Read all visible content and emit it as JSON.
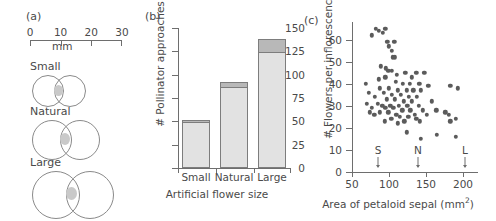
{
  "figure": {
    "panel_a_label": "(a)",
    "panel_b_label": "(b)",
    "panel_c_label": "(c)"
  },
  "panel_a": {
    "scale": {
      "ticks": [
        "0",
        "10",
        "20",
        "30"
      ],
      "unit_label": "mm",
      "min": 0,
      "max": 30
    },
    "models": [
      {
        "name": "Small",
        "circle_diameter_mm": 11,
        "center_diameter_mm": 4
      },
      {
        "name": "Natural",
        "circle_diameter_mm": 15,
        "center_diameter_mm": 4
      },
      {
        "name": "Large",
        "circle_diameter_mm": 19,
        "center_diameter_mm": 4
      }
    ]
  },
  "chart_data": [
    {
      "panel": "(b)",
      "type": "bar",
      "title": "",
      "xlabel": "Artificial flower size",
      "ylabel": "# Pollinator approaches",
      "categories": [
        "Small",
        "Natural",
        "Large"
      ],
      "values": [
        52,
        92,
        138
      ],
      "series": [
        {
          "name": "lower segment",
          "values": [
            50,
            87,
            124
          ],
          "color": "#e2e2e2"
        },
        {
          "name": "upper segment",
          "values": [
            2,
            5,
            14
          ],
          "color": "#b8b8b8"
        }
      ],
      "ylim": [
        0,
        150
      ],
      "yticks": [
        0,
        25,
        50,
        75,
        100,
        125,
        150
      ],
      "grid": false,
      "legend": "none"
    },
    {
      "panel": "(c)",
      "type": "scatter",
      "title": "",
      "xlabel": "Area of petaloid sepal (mm2)",
      "xlabel_html": "Area of petaloid sepal (mm<sup>2</sup>)",
      "ylabel": "# Flowers per inflorescence",
      "xlim": [
        50,
        215
      ],
      "ylim": [
        0,
        68
      ],
      "xticks": [
        50,
        100,
        150,
        200
      ],
      "yticks": [
        0,
        10,
        20,
        30,
        40,
        50,
        60
      ],
      "grid": false,
      "legend": "none",
      "annotations": [
        {
          "label": "S",
          "x": 85,
          "type": "arrow-marker"
        },
        {
          "label": "N",
          "x": 140,
          "type": "arrow-marker"
        },
        {
          "label": "L",
          "x": 203,
          "type": "arrow-marker"
        }
      ],
      "point_color": "#5b5b5b",
      "points": [
        [
          82,
          65
        ],
        [
          86,
          64
        ],
        [
          95,
          65
        ],
        [
          92,
          63
        ],
        [
          77,
          62
        ],
        [
          98,
          59
        ],
        [
          107,
          59
        ],
        [
          100,
          57
        ],
        [
          104,
          55
        ],
        [
          105,
          52
        ],
        [
          108,
          52
        ],
        [
          89,
          48
        ],
        [
          96,
          47
        ],
        [
          99,
          46
        ],
        [
          104,
          46
        ],
        [
          122,
          45
        ],
        [
          137,
          45
        ],
        [
          148,
          45
        ],
        [
          131,
          43
        ],
        [
          111,
          44
        ],
        [
          95,
          43
        ],
        [
          86,
          42
        ],
        [
          109,
          41
        ],
        [
          69,
          40
        ],
        [
          119,
          40
        ],
        [
          128,
          40
        ],
        [
          141,
          40
        ],
        [
          153,
          39
        ],
        [
          183,
          39
        ],
        [
          193,
          38
        ],
        [
          88,
          38
        ],
        [
          100,
          38
        ],
        [
          112,
          37
        ],
        [
          124,
          37
        ],
        [
          133,
          37
        ],
        [
          143,
          37
        ],
        [
          73,
          36
        ],
        [
          93,
          36
        ],
        [
          104,
          35
        ],
        [
          116,
          35
        ],
        [
          127,
          34
        ],
        [
          138,
          34
        ],
        [
          81,
          34
        ],
        [
          97,
          33
        ],
        [
          108,
          33
        ],
        [
          120,
          32
        ],
        [
          131,
          32
        ],
        [
          158,
          32
        ],
        [
          70,
          31
        ],
        [
          85,
          31
        ],
        [
          91,
          30
        ],
        [
          102,
          30
        ],
        [
          113,
          30
        ],
        [
          125,
          30
        ],
        [
          140,
          30
        ],
        [
          77,
          29
        ],
        [
          95,
          29
        ],
        [
          106,
          29
        ],
        [
          118,
          28
        ],
        [
          129,
          28
        ],
        [
          146,
          28
        ],
        [
          164,
          28
        ],
        [
          74,
          27
        ],
        [
          88,
          27
        ],
        [
          99,
          27
        ],
        [
          110,
          26
        ],
        [
          135,
          26
        ],
        [
          151,
          26
        ],
        [
          176,
          27
        ],
        [
          181,
          26
        ],
        [
          190,
          24
        ],
        [
          183,
          23
        ],
        [
          115,
          25
        ],
        [
          126,
          25
        ],
        [
          137,
          24
        ],
        [
          80,
          26
        ],
        [
          103,
          24
        ],
        [
          121,
          23
        ],
        [
          142,
          23
        ],
        [
          94,
          23
        ],
        [
          112,
          22
        ],
        [
          124,
          18
        ],
        [
          143,
          15
        ],
        [
          165,
          17
        ],
        [
          190,
          16
        ]
      ]
    }
  ]
}
